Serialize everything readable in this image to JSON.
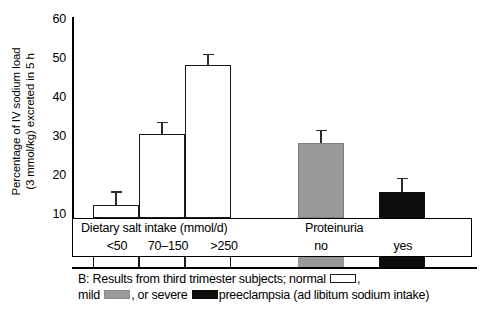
{
  "chart_data": {
    "type": "bar",
    "title": "",
    "xlabel": "",
    "ylabel_line1": "Percentage of IV sodium load",
    "ylabel_line2": "(3 mmol/kg) excreted in 5 h",
    "ylim": [
      10,
      60
    ],
    "yticks": [
      10,
      20,
      30,
      40,
      50,
      60
    ],
    "ytick_labels": [
      "10",
      "20",
      "30",
      "40",
      "50",
      "60"
    ],
    "grid": false,
    "legend_position": "caption-below",
    "groups": [
      {
        "name": "Dietary salt intake (mmol/d)",
        "categories": [
          "<50",
          "70–150",
          ">250"
        ]
      },
      {
        "name": "Proteinuria",
        "categories": [
          "no",
          "yes"
        ]
      }
    ],
    "categories": [
      "<50",
      "70–150",
      ">250",
      "no",
      "yes"
    ],
    "values": [
      13.2,
      31.2,
      48.5,
      28.9,
      16.5
    ],
    "errors": [
      3.2,
      2.6,
      2.4,
      3.0,
      3.2
    ],
    "series": [
      {
        "name": "normal",
        "fill": "#ffffff",
        "points": [
          {
            "category": "<50",
            "value": 13.2,
            "error": 3.2
          },
          {
            "category": "70–150",
            "value": 31.2,
            "error": 2.6
          },
          {
            "category": ">250",
            "value": 48.5,
            "error": 2.4
          }
        ]
      },
      {
        "name": "mild",
        "fill": "#999999",
        "points": [
          {
            "category": "no",
            "value": 28.9,
            "error": 3.0
          }
        ]
      },
      {
        "name": "severe",
        "fill": "#0d0d0d",
        "points": [
          {
            "category": "yes",
            "value": 16.5,
            "error": 3.2
          }
        ]
      }
    ]
  },
  "caption": {
    "line1_a": "B: Results from third trimester subjects; normal",
    "line1_b": ",",
    "line2_a": "mild",
    "line2_b": ", or severe",
    "line2_c": "preeclampsia (ad libitum sodium intake)"
  },
  "colors": {
    "normal": "#ffffff",
    "mild": "#999999",
    "severe": "#0d0d0d",
    "axis": "#000000"
  }
}
